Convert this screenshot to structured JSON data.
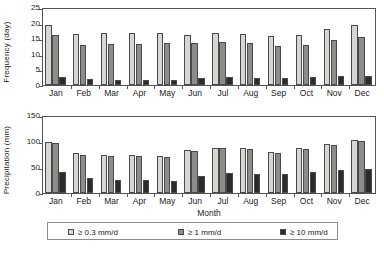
{
  "chart_data": [
    {
      "type": "bar",
      "panel": "top",
      "title": "",
      "xlabel": "",
      "ylabel": "Frequency (day)",
      "categories": [
        "Jan",
        "Feb",
        "Mar",
        "Apr",
        "May",
        "Jun",
        "Jul",
        "Aug",
        "Sep",
        "Oct",
        "Nov",
        "Dec"
      ],
      "ylim": [
        0,
        25
      ],
      "yticks": [
        0,
        5,
        10,
        15,
        20,
        25
      ],
      "ytick_labels": [
        "0",
        "5",
        "10",
        "15",
        "20",
        "25"
      ],
      "grid": false,
      "legend_position": "bottom",
      "series": [
        {
          "name": "≥ 0.3 mm/d",
          "color": "#d6d6d2",
          "values": [
            19.3,
            16.4,
            16.7,
            16.7,
            16.7,
            16.0,
            16.8,
            16.3,
            15.6,
            15.9,
            18.1,
            19.2
          ]
        },
        {
          "name": "≥ 1 mm/d",
          "color": "#8c8c88",
          "values": [
            16.0,
            12.8,
            13.2,
            13.2,
            13.5,
            13.5,
            13.7,
            13.5,
            12.4,
            12.8,
            14.5,
            15.4
          ]
        },
        {
          "name": "≥ 10 mm/d",
          "color": "#2b2b2b",
          "values": [
            2.7,
            2.0,
            1.6,
            1.6,
            1.6,
            2.2,
            2.7,
            2.2,
            2.2,
            2.5,
            2.8,
            2.8
          ]
        }
      ]
    },
    {
      "type": "bar",
      "panel": "bottom",
      "title": "",
      "xlabel": "Month",
      "ylabel": "Precipitation (mm)",
      "categories": [
        "Jan",
        "Feb",
        "Mar",
        "Apr",
        "May",
        "Jun",
        "Jul",
        "Aug",
        "Sep",
        "Oct",
        "Nov",
        "Dec"
      ],
      "ylim": [
        0,
        150
      ],
      "yticks": [
        0,
        50,
        100,
        150
      ],
      "ytick_labels": [
        "0",
        "50",
        "100",
        "150"
      ],
      "grid": false,
      "legend_position": "bottom",
      "series": [
        {
          "name": "≥ 0.3 mm/d",
          "color": "#d6d6d2",
          "values": [
            98,
            76,
            74,
            74,
            71,
            82,
            87,
            87,
            78,
            86,
            95,
            102
          ]
        },
        {
          "name": "≥ 1 mm/d",
          "color": "#8c8c88",
          "values": [
            96,
            74,
            72,
            72,
            69,
            80,
            86,
            85,
            77,
            84,
            93,
            100
          ]
        },
        {
          "name": "≥ 10 mm/d",
          "color": "#2b2b2b",
          "values": [
            40,
            29,
            25,
            25,
            23,
            33,
            39,
            37,
            37,
            41,
            45,
            47
          ]
        }
      ]
    }
  ],
  "legend": {
    "items": [
      {
        "label": "≥ 0.3 mm/d",
        "color": "#d6d6d2"
      },
      {
        "label": "≥ 1 mm/d",
        "color": "#8c8c88"
      },
      {
        "label": "≥ 10 mm/d",
        "color": "#2b2b2b"
      }
    ]
  }
}
